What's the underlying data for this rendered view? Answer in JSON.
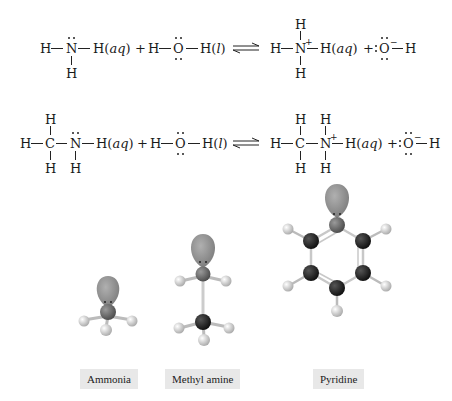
{
  "equations": [
    {
      "id": "ammonia-ionization",
      "reactant1": {
        "atoms": [
          "H",
          "N",
          "H"
        ],
        "below": [
          "H"
        ],
        "state": "(aq)"
      },
      "plus": "+",
      "reactant2": {
        "atoms": [
          "H",
          "O",
          "H"
        ],
        "state": "(l)"
      },
      "arrow": "⇌",
      "product1": {
        "atoms": [
          "H",
          "N",
          "H"
        ],
        "above": [
          "H"
        ],
        "below": [
          "H"
        ],
        "charge": "+",
        "state": "(aq)"
      },
      "product2": {
        "atoms": [
          "O",
          "H"
        ],
        "charge": "−"
      }
    },
    {
      "id": "methylamine-ionization",
      "reactant1": {
        "atoms": [
          "H",
          "C",
          "N",
          "H"
        ],
        "above": [
          "H"
        ],
        "below": [
          "H",
          "H"
        ],
        "state": "(aq)"
      },
      "plus": "+",
      "reactant2": {
        "atoms": [
          "H",
          "O",
          "H"
        ],
        "state": "(l)"
      },
      "arrow": "⇌",
      "product1": {
        "atoms": [
          "H",
          "C",
          "N",
          "H"
        ],
        "above": [
          "H",
          "H"
        ],
        "below": [
          "H",
          "H"
        ],
        "charge": "+",
        "state": "(aq)"
      },
      "product2": {
        "atoms": [
          "O",
          "H"
        ],
        "charge": "−"
      }
    }
  ],
  "text": {
    "H": "H",
    "N": "N",
    "O": "O",
    "C": "C",
    "aq": "aq",
    "l": "l",
    "plus": "+",
    "arrow": "⇌",
    "pos": "+",
    "neg": "−",
    "open": "(",
    "close": ")"
  },
  "models": [
    {
      "name": "ammonia",
      "label": "Ammonia"
    },
    {
      "name": "methyl-amine",
      "label": "Methyl amine"
    },
    {
      "name": "pyridine",
      "label": "Pyridine"
    }
  ],
  "colors": {
    "lone_pair_lobe": "#8a8a8a",
    "nitrogen": "#6e6e6e",
    "carbon": "#1c1c1c",
    "hydrogen": "#d8d8d8",
    "label_bg": "#e8e8e8"
  }
}
